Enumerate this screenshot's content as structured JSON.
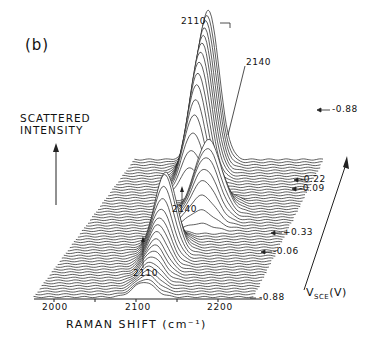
{
  "figure": {
    "panel_label": "(b)",
    "y_axis_label_line1": "SCATTERED",
    "y_axis_label_line2": "INTENSITY",
    "x_axis_label": "RAMAN SHIFT (cm⁻¹)",
    "depth_axis_label_main": "V",
    "depth_axis_label_sub": "SCE",
    "depth_axis_label_unit": "(V)",
    "x_ticks": [
      "2000",
      "2100",
      "2200"
    ],
    "peak_annotations": {
      "top_2110": "2110",
      "top_2140": "2140",
      "mid_2140": "2140",
      "low_2110": "2110"
    },
    "potential_labels": [
      {
        "text": "-0.88",
        "position": "back"
      },
      {
        "text": "-0.22",
        "position": "upper"
      },
      {
        "text": "-0.09",
        "position": "upper"
      },
      {
        "text": "+0.33",
        "position": "middle"
      },
      {
        "text": "-0.06",
        "position": "lower"
      },
      {
        "text": "-0.88",
        "position": "front"
      }
    ]
  },
  "chart_data": {
    "type": "line",
    "subtype": "waterfall",
    "title": "(b)",
    "xlabel": "RAMAN SHIFT (cm⁻¹)",
    "ylabel": "SCATTERED INTENSITY",
    "zlabel": "V_SCE (V)",
    "xlim": [
      1975,
      2235
    ],
    "x_ticks": [
      2000,
      2050,
      2100,
      2150,
      2200
    ],
    "x_tick_labels": [
      "2000",
      "",
      "2100",
      "",
      "2200"
    ],
    "grid": false,
    "legend": "none",
    "potential_sequence_labels": [
      "-0.88",
      "-0.06",
      "+0.33",
      "-0.09",
      "-0.22",
      "-0.88"
    ],
    "potential_sweep": "cathodic start -0.88 V, anodic to +0.33 V, return to -0.88 V",
    "num_traces": 51,
    "bands_cm-1": [
      2110,
      2140
    ],
    "series": [
      {
        "segment": "-0.88 to -0.06 (traces 0-16)",
        "peak_position": 2110,
        "relative_peak_height": [
          0.1,
          0.1,
          0.11,
          0.12,
          0.13,
          0.14,
          0.16,
          0.18,
          0.2,
          0.22,
          0.25,
          0.28,
          0.31,
          0.35,
          0.4,
          0.46,
          0.52
        ]
      },
      {
        "segment": "-0.06 to +0.33 (traces 17-23)",
        "peak_position": 2110,
        "relative_peak_height": [
          0.52,
          0.4,
          0.3,
          0.2,
          0.12,
          0.06,
          0.03
        ]
      },
      {
        "segment": "+0.33 to -0.09 (traces 24-31)",
        "peak_position": 2140,
        "relative_peak_height": [
          0.05,
          0.12,
          0.2,
          0.28,
          0.34,
          0.4,
          0.44,
          0.48
        ]
      },
      {
        "segment": "-0.09 to -0.22 (traces 32-35)",
        "peak_position": 2140,
        "relative_peak_height": [
          0.4,
          0.3,
          0.22,
          0.15
        ]
      },
      {
        "segment": "-0.22 to -0.88 (traces 36-50)",
        "peak_position": 2110,
        "relative_peak_height": [
          0.2,
          0.3,
          0.4,
          0.5,
          0.58,
          0.66,
          0.72,
          0.78,
          0.83,
          0.87,
          0.9,
          0.93,
          0.96,
          0.98,
          1.0
        ]
      }
    ],
    "annotations": [
      "2110",
      "2140",
      "2140",
      "2110",
      "-0.88",
      "-0.22",
      "-0.09",
      "+0.33",
      "-0.06",
      "-0.88"
    ]
  }
}
